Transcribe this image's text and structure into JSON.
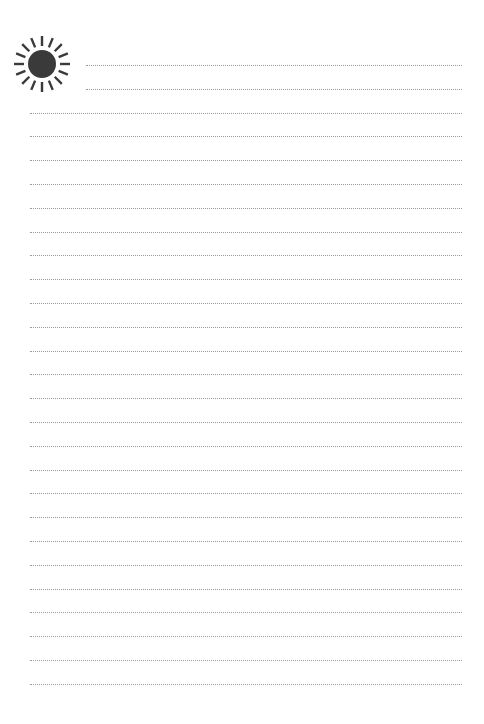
{
  "page": {
    "type": "lined-notepaper",
    "icon": "sun-icon",
    "colors": {
      "background": "#ffffff",
      "line": "#9a9a9a",
      "sun": "#3a3a3a"
    },
    "lines": {
      "first_y": 65,
      "spacing": 23.8,
      "count": 27,
      "short_lines": 2,
      "short_start_x": 86,
      "full_start_x": 30,
      "end_x": 462
    }
  }
}
